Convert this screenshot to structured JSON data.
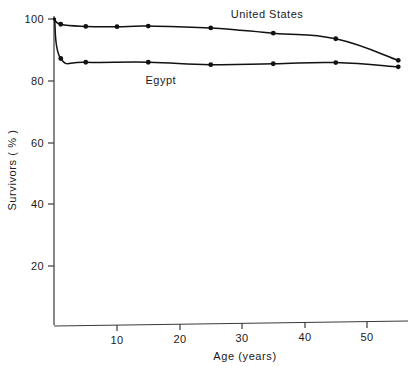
{
  "chart_data": {
    "type": "line",
    "title": "",
    "xlabel": "Age (years)",
    "ylabel": "Survivors ( % )",
    "xlim": [
      0,
      56.5
    ],
    "ylim": [
      0,
      103
    ],
    "grid": false,
    "legend_position": "inline-annotations",
    "xticks": [
      10,
      20,
      30,
      40,
      50
    ],
    "xtick_labels": [
      "10",
      "20",
      "30",
      "40",
      "50"
    ],
    "yticks": [
      20,
      40,
      60,
      80,
      100
    ],
    "ytick_labels": [
      "20",
      "40",
      "60",
      "80",
      "100"
    ],
    "series": [
      {
        "name": "United States",
        "label_text": "United States",
        "x": [
          0,
          1,
          5,
          10,
          15,
          25,
          35,
          45,
          55
        ],
        "values": [
          100,
          98.3,
          97.6,
          97.5,
          97.7,
          97.1,
          95.4,
          93.6,
          86.6
        ]
      },
      {
        "name": "Egypt",
        "label_text": "Egypt",
        "x": [
          0,
          1,
          5,
          15,
          25,
          35,
          45,
          55
        ],
        "values": [
          100,
          87.2,
          86.0,
          86.0,
          85.2,
          85.5,
          85.9,
          84.5
        ]
      }
    ],
    "annotations": [
      {
        "text": "United States",
        "x": 34.0,
        "y": 100.5
      },
      {
        "text": "Egypt",
        "x": 17.0,
        "y": 79.0
      }
    ],
    "colors": {
      "line": "#111111",
      "marker": "#111111",
      "axis": "#3a3a3a",
      "text": "#1a1a1a",
      "background": "#ffffff"
    }
  }
}
